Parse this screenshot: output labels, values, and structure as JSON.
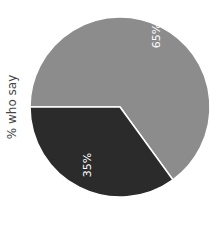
{
  "chart_data": {
    "type": "pie",
    "title": "",
    "ylabel": "% who say",
    "slices": [
      {
        "label": "65%",
        "value": 65,
        "color": "#8c8c8c"
      },
      {
        "label": "35%",
        "value": 35,
        "color": "#2b2b2b"
      }
    ],
    "label_orientation": "rotated -90deg",
    "legend": "none"
  }
}
